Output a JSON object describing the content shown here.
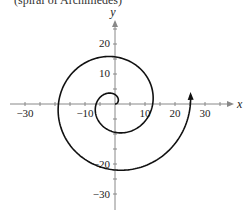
{
  "caption": "(spiral of Archimedes)",
  "chart_data": {
    "type": "line",
    "title": "(spiral of Archimedes)",
    "equation": "r = 2θ, 0 ≤ θ ≤ 4π",
    "xlabel": "x",
    "ylabel": "y",
    "xlim": [
      -35,
      38
    ],
    "ylim": [
      -35,
      27
    ],
    "x_ticks": [
      -30,
      -10,
      10,
      20,
      30
    ],
    "y_ticks": [
      20,
      10,
      -20,
      -30
    ],
    "x_tick_labels": [
      "−30",
      "−10",
      "10",
      "20",
      "30"
    ],
    "y_tick_labels": [
      "20",
      "10",
      "−20",
      "−30"
    ],
    "minor_tick_step": 5,
    "grid": false,
    "series": [
      {
        "name": "spiral",
        "points_polar_theta_r": [
          [
            0,
            0
          ],
          [
            1.571,
            3.14
          ],
          [
            3.142,
            6.28
          ],
          [
            4.712,
            9.42
          ],
          [
            6.283,
            12.57
          ],
          [
            7.854,
            15.71
          ],
          [
            9.425,
            18.85
          ],
          [
            10.996,
            21.99
          ],
          [
            12.566,
            25.13
          ]
        ],
        "points_xy": [
          [
            0,
            0
          ],
          [
            0,
            3.1
          ],
          [
            -6.3,
            0
          ],
          [
            0,
            -9.4
          ],
          [
            12.6,
            0
          ],
          [
            0,
            15.7
          ],
          [
            -18.8,
            0
          ],
          [
            0,
            -22.0
          ],
          [
            25.1,
            0
          ]
        ],
        "end_arrow": true
      }
    ]
  },
  "axes": {
    "x_name": "x",
    "y_name": "y",
    "x_labels": [
      "−30",
      "−10",
      "10",
      "20",
      "30"
    ],
    "y_labels": [
      "20",
      "10",
      "−20",
      "−30"
    ]
  }
}
